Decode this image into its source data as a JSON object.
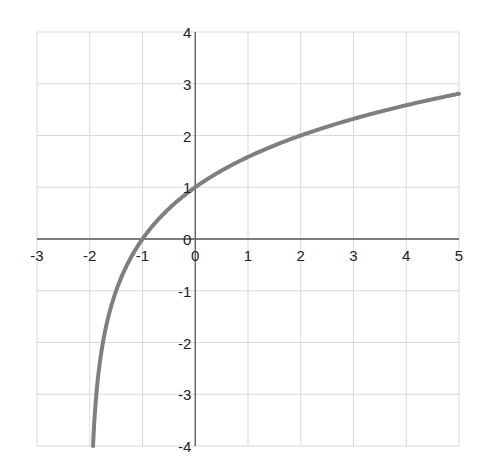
{
  "chart_data": {
    "type": "line",
    "title": "",
    "xlabel": "",
    "ylabel": "",
    "function": "y = log2(x + 2)",
    "xlim": [
      -3,
      5
    ],
    "ylim": [
      -4,
      4
    ],
    "grid": true,
    "legend": null,
    "x_ticks": [
      "-3",
      "-2",
      "-1",
      "0",
      "1",
      "2",
      "3",
      "4",
      "5"
    ],
    "y_ticks": [
      "4",
      "3",
      "2",
      "1",
      "0",
      "-1",
      "-2",
      "-3",
      "-4"
    ],
    "series": [
      {
        "name": "curve",
        "color": "#7f7f7f",
        "x": [
          -1.9375,
          -1.875,
          -1.75,
          -1.5,
          -1.0,
          0,
          1,
          2,
          3,
          4,
          5
        ],
        "y": [
          -4,
          -3,
          -2,
          -1,
          0,
          1,
          1.585,
          2,
          2.322,
          2.585,
          2.807
        ]
      }
    ],
    "colors": {
      "grid": "#d9d9d9",
      "axis": "#595959",
      "curve": "#7f7f7f"
    }
  }
}
